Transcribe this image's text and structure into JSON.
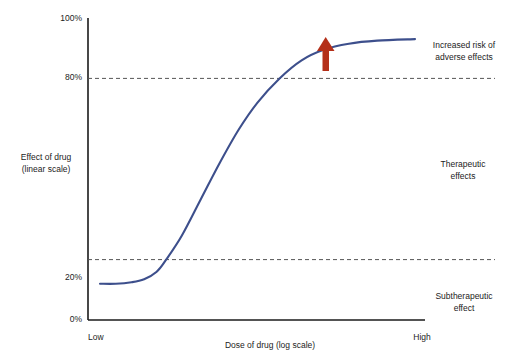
{
  "chart_data": {
    "type": "line",
    "title": "",
    "xlabel": "Dose of drug (log scale)",
    "ylabel_line1": "Effect of drug",
    "ylabel_line2": "(linear scale)",
    "x_tick_labels": [
      "Low",
      "High"
    ],
    "y_tick_labels": [
      "0%",
      "20%",
      "80%",
      "100%"
    ],
    "ylim": [
      0,
      100
    ],
    "grid": "horizontal dashed at 20% and 80%",
    "legend": "none",
    "series": [
      {
        "name": "Dose-response curve",
        "color": "#3d4f8c",
        "points": [
          {
            "x": 0.0,
            "y": 12
          },
          {
            "x": 0.05,
            "y": 12
          },
          {
            "x": 0.1,
            "y": 12.5
          },
          {
            "x": 0.14,
            "y": 13.5
          },
          {
            "x": 0.18,
            "y": 16
          },
          {
            "x": 0.21,
            "y": 20
          },
          {
            "x": 0.26,
            "y": 28
          },
          {
            "x": 0.32,
            "y": 40
          },
          {
            "x": 0.38,
            "y": 52
          },
          {
            "x": 0.44,
            "y": 63
          },
          {
            "x": 0.5,
            "y": 72
          },
          {
            "x": 0.57,
            "y": 80
          },
          {
            "x": 0.64,
            "y": 86
          },
          {
            "x": 0.71,
            "y": 89.5
          },
          {
            "x": 0.79,
            "y": 91.5
          },
          {
            "x": 0.88,
            "y": 92.5
          },
          {
            "x": 1.0,
            "y": 93
          }
        ]
      }
    ],
    "threshold_lines": [
      {
        "value": 80,
        "style": "dashed",
        "color": "#555555"
      },
      {
        "value": 20,
        "style": "dashed",
        "color": "#555555"
      }
    ],
    "annotations": [
      {
        "name": "increased-risk",
        "line1": "Increased risk of",
        "line2": "adverse effects"
      },
      {
        "name": "therapeutic",
        "line1": "Therapeutic",
        "line2": "effects"
      },
      {
        "name": "subtherapeutic",
        "line1": "Subtherapeutic",
        "line2": "effect"
      }
    ],
    "marker": {
      "name": "up-arrow",
      "color": "#b4301a",
      "description": "Red upward arrow pointing at plateau of curve"
    }
  },
  "colors": {
    "curve": "#3d4f8c",
    "arrow": "#b4301a",
    "axis": "#1a1a1a",
    "gridline": "#555555",
    "text": "#1c1c1c",
    "background": "#ffffff"
  }
}
